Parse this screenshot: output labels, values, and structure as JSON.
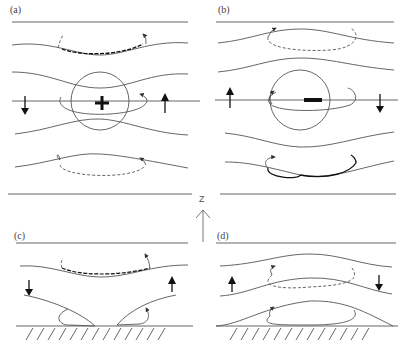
{
  "figure": {
    "panels": [
      {
        "id": "a",
        "label": "(a)",
        "anomaly_sign": "+",
        "vertical_arrows": {
          "left": "down",
          "right": "up"
        }
      },
      {
        "id": "b",
        "label": "(b)",
        "anomaly_sign": "−",
        "vertical_arrows": {
          "left": "up",
          "right": "down"
        }
      },
      {
        "id": "c",
        "label": "(c)",
        "anomaly_sign": "",
        "vertical_arrows": {
          "left": "down",
          "right": "up"
        },
        "has_ground": true
      },
      {
        "id": "d",
        "label": "(d)",
        "anomaly_sign": "",
        "vertical_arrows": {
          "left": "up",
          "right": "down"
        },
        "has_ground": true
      }
    ],
    "axis": {
      "label": "Z",
      "direction": "up"
    },
    "colors": {
      "line": "#444444",
      "thick": "#111111",
      "background": "#ffffff"
    }
  }
}
